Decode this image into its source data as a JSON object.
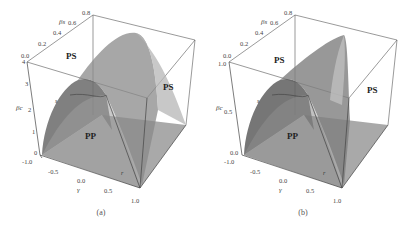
{
  "figure": {
    "panels": [
      {
        "caption": "(a)",
        "axes": {
          "top_axis_label": "βs",
          "top_ticks": [
            "0.0",
            "0.2",
            "0.4",
            "0.6",
            "0.8"
          ],
          "vertical_axis_label": "βc",
          "vertical_ticks": [
            "0",
            "1",
            "2",
            "3",
            "4"
          ],
          "bottom_axis_label": "γ",
          "bottom_ticks": [
            "-1.0",
            "-0.5",
            "0.0",
            "0.5",
            "1.0"
          ]
        },
        "regions": {
          "upper_left": "PS",
          "right": "PS",
          "lower": "PP"
        },
        "curve_labels": {
          "s": "s",
          "r": "r"
        }
      },
      {
        "caption": "(b)",
        "axes": {
          "top_axis_label": "βs",
          "top_ticks": [
            "0.0",
            "0.2",
            "0.4",
            "0.6",
            "0.8"
          ],
          "vertical_axis_label": "βc",
          "vertical_ticks": [
            "0.0",
            "0.5",
            "1.0"
          ],
          "bottom_axis_label": "γ",
          "bottom_ticks": [
            "-1.0",
            "-0.5",
            "0.0",
            "0.5",
            "1.0"
          ]
        },
        "regions": {
          "upper_left": "PS",
          "right": "PS",
          "lower": "PP"
        },
        "curve_labels": {
          "s": "s",
          "r": "r"
        }
      }
    ]
  }
}
